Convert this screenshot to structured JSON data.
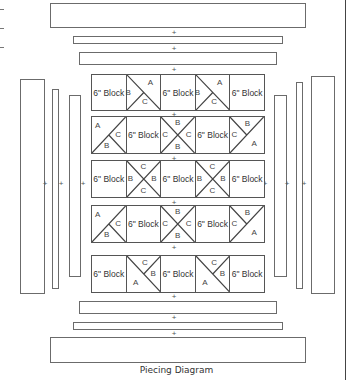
{
  "diagram": {
    "caption": "Piecing Diagram",
    "plus_symbol": "+",
    "block_label": "6\" Block",
    "top_borders": [
      {
        "name": "outer-border-top",
        "x": 50,
        "y": 3,
        "w": 256,
        "h": 25
      },
      {
        "name": "middle-border-top",
        "x": 73,
        "y": 36,
        "w": 210,
        "h": 8
      },
      {
        "name": "inner-border-top",
        "x": 79,
        "y": 52,
        "w": 198,
        "h": 13
      }
    ],
    "bottom_borders": [
      {
        "name": "inner-border-bottom",
        "x": 79,
        "y": 301,
        "w": 198,
        "h": 13
      },
      {
        "name": "middle-border-bottom",
        "x": 73,
        "y": 322,
        "w": 210,
        "h": 8
      },
      {
        "name": "outer-border-bottom",
        "x": 50,
        "y": 337,
        "w": 256,
        "h": 26
      }
    ],
    "left_borders": [
      {
        "name": "outer-border-left",
        "x": 20,
        "y": 79,
        "w": 25,
        "h": 215
      },
      {
        "name": "middle-border-left",
        "x": 52,
        "y": 89,
        "w": 7,
        "h": 200
      },
      {
        "name": "inner-border-left",
        "x": 69,
        "y": 95,
        "w": 12,
        "h": 182
      }
    ],
    "right_borders": [
      {
        "name": "inner-border-right",
        "x": 274,
        "y": 95,
        "w": 13,
        "h": 182
      },
      {
        "name": "middle-border-right",
        "x": 296,
        "y": 82,
        "w": 7,
        "h": 207
      },
      {
        "name": "outer-border-right",
        "x": 311,
        "y": 76,
        "w": 24,
        "h": 218
      }
    ],
    "rows": [
      {
        "y": 74,
        "h": 37,
        "cells": [
          {
            "type": "block",
            "label": "6\" Block"
          },
          {
            "type": "tri",
            "pattern": "diag-tl-br-half",
            "labels": {
              "B": [
                6,
                50
              ],
              "A": [
                72,
                22
              ],
              "C": [
                55,
                78
              ]
            }
          },
          {
            "type": "block",
            "label": "6\" Block"
          },
          {
            "type": "tri",
            "pattern": "diag-tl-br-half",
            "labels": {
              "B": [
                6,
                50
              ],
              "A": [
                72,
                22
              ],
              "C": [
                55,
                78
              ]
            }
          },
          {
            "type": "block",
            "label": "6\" Block"
          }
        ]
      },
      {
        "y": 116,
        "h": 38,
        "cells": [
          {
            "type": "tri",
            "pattern": "diag-tr-bl-half",
            "labels": {
              "A": [
                18,
                25
              ],
              "C": [
                78,
                50
              ],
              "B": [
                45,
                80
              ]
            }
          },
          {
            "type": "block",
            "label": "6\" Block"
          },
          {
            "type": "tri",
            "pattern": "x",
            "labels": {
              "B": [
                50,
                18
              ],
              "C": [
                12,
                50
              ],
              "C2": [
                82,
                50
              ],
              "B2": [
                50,
                82
              ]
            }
          },
          {
            "type": "block",
            "label": "6\" Block"
          },
          {
            "type": "tri",
            "pattern": "diag-tr-bl-half-r",
            "labels": {
              "B": [
                52,
                20
              ],
              "C": [
                12,
                50
              ],
              "A": [
                72,
                75
              ]
            }
          }
        ]
      },
      {
        "y": 160,
        "h": 38,
        "cells": [
          {
            "type": "block",
            "label": "6\" Block"
          },
          {
            "type": "tri",
            "pattern": "x",
            "labels": {
              "C": [
                50,
                18
              ],
              "B": [
                12,
                50
              ],
              "B2": [
                82,
                50
              ],
              "C2": [
                50,
                82
              ]
            }
          },
          {
            "type": "block",
            "label": "6\" Block"
          },
          {
            "type": "tri",
            "pattern": "x",
            "labels": {
              "C": [
                50,
                18
              ],
              "B": [
                12,
                50
              ],
              "B2": [
                82,
                50
              ],
              "C2": [
                50,
                82
              ]
            }
          },
          {
            "type": "block",
            "label": "6\" Block"
          }
        ]
      },
      {
        "y": 205,
        "h": 38,
        "cells": [
          {
            "type": "tri",
            "pattern": "diag-tr-bl-half",
            "labels": {
              "A": [
                18,
                25
              ],
              "C": [
                78,
                50
              ],
              "B": [
                45,
                80
              ]
            }
          },
          {
            "type": "block",
            "label": "6\" Block"
          },
          {
            "type": "tri",
            "pattern": "x",
            "labels": {
              "B": [
                50,
                18
              ],
              "C": [
                12,
                50
              ],
              "C2": [
                82,
                50
              ],
              "B2": [
                50,
                82
              ]
            }
          },
          {
            "type": "block",
            "label": "6\" Block"
          },
          {
            "type": "tri",
            "pattern": "diag-tr-bl-half-r",
            "labels": {
              "B": [
                52,
                20
              ],
              "C": [
                12,
                50
              ],
              "A": [
                72,
                75
              ]
            }
          }
        ]
      },
      {
        "y": 255,
        "h": 38,
        "cells": [
          {
            "type": "block",
            "label": "6\" Block"
          },
          {
            "type": "tri",
            "pattern": "diag-tl-br-half-b",
            "labels": {
              "C": [
                55,
                20
              ],
              "B": [
                80,
                50
              ],
              "A": [
                28,
                75
              ]
            }
          },
          {
            "type": "block",
            "label": "6\" Block"
          },
          {
            "type": "tri",
            "pattern": "diag-tl-br-half-b",
            "labels": {
              "C": [
                55,
                20
              ],
              "B": [
                80,
                50
              ],
              "A": [
                28,
                75
              ]
            }
          },
          {
            "type": "block",
            "label": "6\" Block"
          }
        ]
      }
    ],
    "plus_positions": [
      {
        "x": 174,
        "y": 29
      },
      {
        "x": 174,
        "y": 45
      },
      {
        "x": 174,
        "y": 66
      },
      {
        "x": 174,
        "y": 111
      },
      {
        "x": 174,
        "y": 155
      },
      {
        "x": 174,
        "y": 199
      },
      {
        "x": 174,
        "y": 244
      },
      {
        "x": 174,
        "y": 293
      },
      {
        "x": 174,
        "y": 314
      },
      {
        "x": 174,
        "y": 330
      },
      {
        "x": 45,
        "y": 180
      },
      {
        "x": 61,
        "y": 180
      },
      {
        "x": 83,
        "y": 180
      },
      {
        "x": 265,
        "y": 180
      },
      {
        "x": 287,
        "y": 180
      },
      {
        "x": 304,
        "y": 180
      }
    ]
  }
}
